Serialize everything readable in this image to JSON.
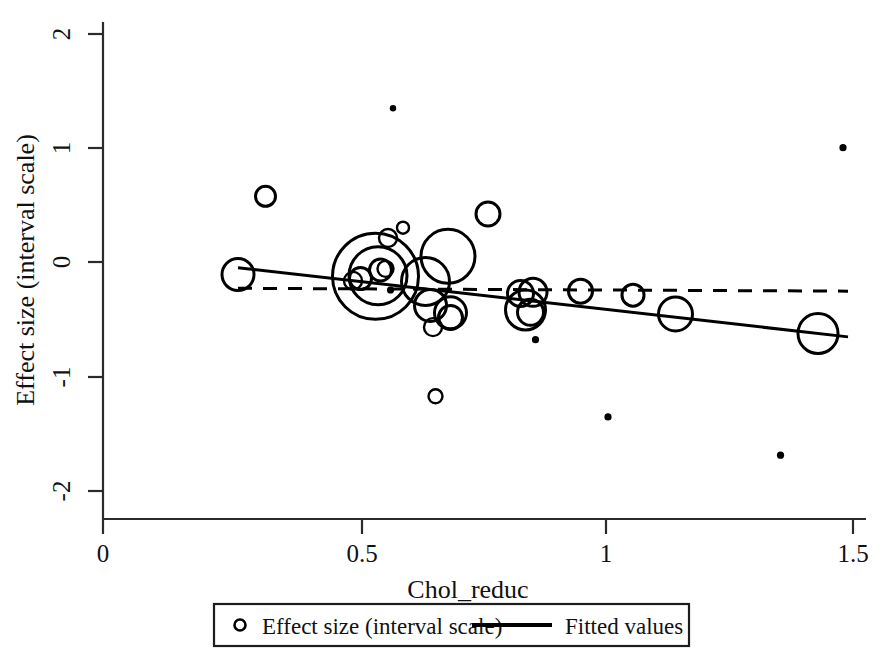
{
  "chart_data": {
    "type": "scatter",
    "title": "",
    "subtitle": "",
    "xlabel": "Chol_reduc",
    "ylabel": "Effect size (interval scale)",
    "xlim": [
      0,
      1.5
    ],
    "ylim": [
      -2,
      2
    ],
    "xticks": [
      "0",
      "0.5",
      "1",
      "1.5"
    ],
    "xtick_values": [
      0,
      0.5,
      1,
      1.5
    ],
    "yticks": [
      "2",
      "1",
      "0",
      "-1",
      "-2"
    ],
    "ytick_values": [
      2,
      1,
      0,
      -1,
      -2
    ],
    "grid": false,
    "legend_position": "bottom-center",
    "legend": [
      {
        "label": "Effect size (interval scale)",
        "marker": "open-circle"
      },
      {
        "label": "Fitted values",
        "marker": "solid-line"
      }
    ],
    "series": [
      {
        "name": "Effect size (interval scale)",
        "marker": "bubble",
        "note": "bubble radius proportional to study weight / precision",
        "points": [
          {
            "x": 0.27,
            "y": -0.11,
            "size": 16
          },
          {
            "x": 0.325,
            "y": 0.575,
            "size": 10
          },
          {
            "x": 0.5,
            "y": -0.165,
            "size": 9
          },
          {
            "x": 0.515,
            "y": -0.145,
            "size": 11
          },
          {
            "x": 0.545,
            "y": -0.125,
            "size": 43
          },
          {
            "x": 0.55,
            "y": -0.12,
            "size": 29
          },
          {
            "x": 0.555,
            "y": -0.07,
            "size": 11
          },
          {
            "x": 0.565,
            "y": -0.06,
            "size": 8
          },
          {
            "x": 0.57,
            "y": 0.21,
            "size": 9
          },
          {
            "x": 0.575,
            "y": -0.245,
            "size": 5
          },
          {
            "x": 0.58,
            "y": 1.345,
            "size": 4
          },
          {
            "x": 0.6,
            "y": 0.3,
            "size": 6
          },
          {
            "x": 0.645,
            "y": -0.17,
            "size": 24
          },
          {
            "x": 0.655,
            "y": -0.38,
            "size": 16
          },
          {
            "x": 0.66,
            "y": -0.57,
            "size": 9
          },
          {
            "x": 0.665,
            "y": -1.175,
            "size": 7
          },
          {
            "x": 0.69,
            "y": 0.05,
            "size": 27
          },
          {
            "x": 0.695,
            "y": -0.485,
            "size": 12
          },
          {
            "x": 0.695,
            "y": -0.445,
            "size": 16
          },
          {
            "x": 0.77,
            "y": 0.42,
            "size": 12
          },
          {
            "x": 0.835,
            "y": -0.275,
            "size": 13
          },
          {
            "x": 0.845,
            "y": -0.42,
            "size": 20
          },
          {
            "x": 0.855,
            "y": -0.44,
            "size": 13
          },
          {
            "x": 0.86,
            "y": -0.265,
            "size": 14
          },
          {
            "x": 0.865,
            "y": -0.68,
            "size": 5
          },
          {
            "x": 0.955,
            "y": -0.255,
            "size": 12
          },
          {
            "x": 1.01,
            "y": -1.355,
            "size": 5
          },
          {
            "x": 1.06,
            "y": -0.29,
            "size": 11
          },
          {
            "x": 1.145,
            "y": -0.455,
            "size": 17
          },
          {
            "x": 1.355,
            "y": -1.69,
            "size": 5
          },
          {
            "x": 1.43,
            "y": -0.625,
            "size": 20
          },
          {
            "x": 1.48,
            "y": 1.0,
            "size": 5
          }
        ]
      },
      {
        "name": "Fitted values",
        "marker": "solid-line",
        "line": {
          "x_start": 0.27,
          "y_start": -0.05,
          "x_end": 1.49,
          "y_end": -0.655
        }
      },
      {
        "name": "Reference line",
        "marker": "dashed-line",
        "line": {
          "x_start": 0.27,
          "y_start": -0.23,
          "x_end": 1.49,
          "y_end": -0.255
        }
      }
    ]
  },
  "axes": {
    "x": {
      "title": "Chol_reduc",
      "ticks": [
        "0",
        "0.5",
        "1",
        "1.5"
      ]
    },
    "y": {
      "title": "Effect size (interval scale)",
      "ticks": [
        "2",
        "1",
        "0",
        "-1",
        "-2"
      ]
    }
  },
  "legend": {
    "entry_scatter": "Effect size (interval scale)",
    "entry_line": "Fitted values"
  },
  "colors": {
    "marker_stroke": "#000000",
    "fit_line": "#000000",
    "reference_line": "#000000",
    "axis": "#2b2b2b",
    "background": "#ffffff",
    "text": "#111111"
  }
}
